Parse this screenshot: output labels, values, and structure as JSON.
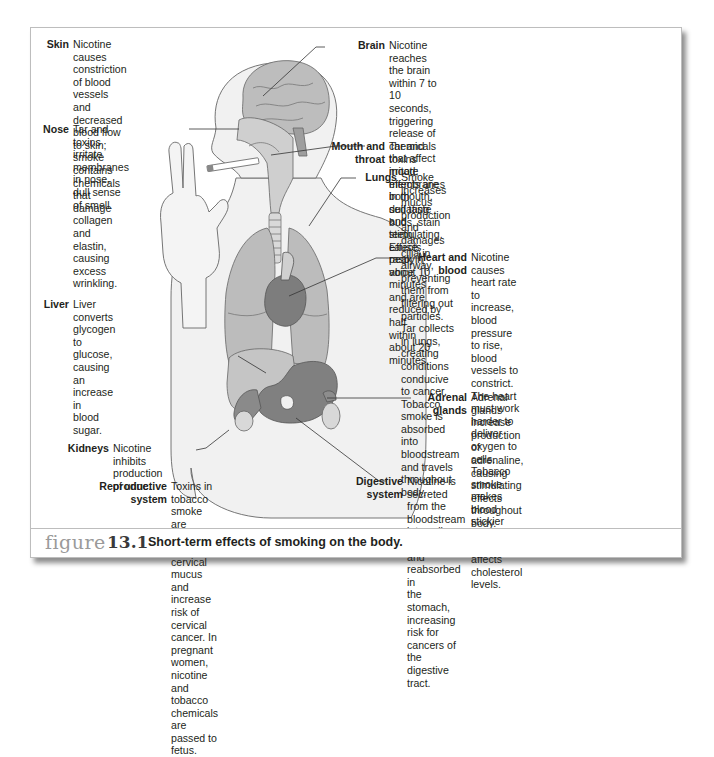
{
  "figure": {
    "label_word": "figure",
    "label_number": "13.1",
    "caption": "Short-term effects of smoking on the body."
  },
  "annotations": {
    "skin": {
      "label": "Skin",
      "text": "Nicotine causes constriction of blood\nvessels and decreased blood flow\nto skin; smoke contains chemicals\nthat damage collagen and\nelastin, causing excess\nwrinkling."
    },
    "nose": {
      "label": "Nose",
      "text": "Tar and toxins irritate\nmembranes in nose,\ndull sense of smell."
    },
    "liver": {
      "label": "Liver",
      "text": "Liver converts\nglycogen to\nglucose, causing\nan increase in\nblood sugar."
    },
    "kidneys": {
      "label": "Kidneys",
      "text": "Nicotine inhibits\nproduction of urine."
    },
    "reproductive": {
      "label": "Reproductive\nsystem",
      "text": "Toxins in tobacco smoke are secreted into\ncervical mucus and increase risk of cervical\ncancer. In pregnant women, nicotine and\ntobacco chemicals are passed to fetus."
    },
    "brain": {
      "label": "Brain",
      "text": "Nicotine reaches the brain within 7 to 10 seconds,\ntriggering release of chemicals that affect mood;\neffects are both sedating and stimulating. Effects\npeak in about 10 minutes and are reduced by half\nwithin about 20 minutes."
    },
    "mouth": {
      "label": "Mouth and\nthroat",
      "text": "Tar and toxins irritate membranes\nin mouth, dull taste buds, stain teeth,\ncause raspy voice."
    },
    "lungs": {
      "label": "Lungs",
      "text": "Smoke increases mucus production and damages\ncilia in airway, preventing them from filtering out\nparticles. Tar collects in lungs, creating conditions\nconducive to cancer. Tobacco smoke is absorbed\ninto bloodstream and travels throughout body."
    },
    "heart": {
      "label": "Heart and\nblood",
      "text": "Nicotine causes heart rate\nto increase, blood pressure\nto rise, blood vessels to constrict.\nThe heart must work harder to\ndeliver oxygen to cells. Tobacco\nsmoke makes blood stickier and\nadversely affects cholesterol levels."
    },
    "adrenal": {
      "label": "Adrenal\nglands",
      "text": "Adrenal glands increase\nproduction of adrenaline,\ncausing stimulating\neffects throughout\nbody."
    },
    "digestive": {
      "label": "Digestive\nsystem",
      "text": "Nicotine is secreted from the bloodstream\ninto saliva, swallowed, and reabsorbed in\nthe stomach, increasing risk for cancers of\nthe digestive tract."
    }
  },
  "colors": {
    "body_fill": "#efefef",
    "organ_light": "#bdbdbd",
    "organ_mid": "#9e9e9e",
    "organ_dark": "#7a7a7a",
    "outline": "#555555",
    "frame_border": "#bdbdbd",
    "caption_figure_word": "#9a9a9a"
  }
}
